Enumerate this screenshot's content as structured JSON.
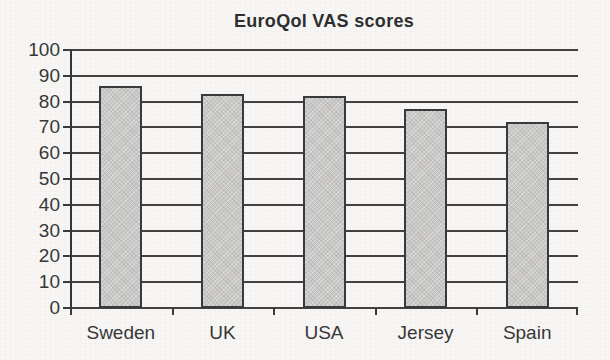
{
  "chart_data": {
    "type": "bar",
    "title": "EuroQol VAS scores",
    "categories": [
      "Sweden",
      "UK",
      "USA",
      "Jersey",
      "Spain"
    ],
    "values": [
      86,
      83,
      82,
      77,
      72
    ],
    "xlabel": "",
    "ylabel": "",
    "ylim": [
      0,
      100
    ],
    "ytick_step": 10,
    "grid": true,
    "legend_position": "none",
    "colors": {
      "bar_fill": "#c9c8c6",
      "bar_border": "#3a3a3c",
      "gridline": "#434240",
      "axis": "#353535",
      "text": "#383838",
      "background": "#f7f6f4"
    }
  }
}
